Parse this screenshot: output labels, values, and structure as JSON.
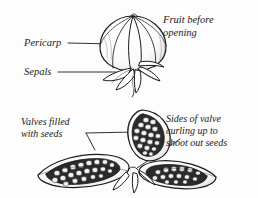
{
  "figure": {
    "background_color": "#fdfdfd",
    "ink_color": "#1a1a1a",
    "labels": {
      "pericarp": "Pericarp",
      "sepals": "Sepals",
      "fruit_before_line1": "Fruit before",
      "fruit_before_line2": "opening",
      "valves_line1": "Valves filled",
      "valves_line2": "with seeds",
      "sides_line1": "Sides of valve",
      "sides_line2": "curling up to",
      "sides_line3": "shoot out seeds"
    },
    "panels": [
      {
        "name": "closed-fruit",
        "caption": "Fruit before opening",
        "annotations": [
          "Pericarp",
          "Sepals"
        ]
      },
      {
        "name": "opened-fruit",
        "caption": "Sides of valve curling up to shoot out seeds",
        "annotations": [
          "Valves filled with seeds"
        ]
      }
    ]
  }
}
